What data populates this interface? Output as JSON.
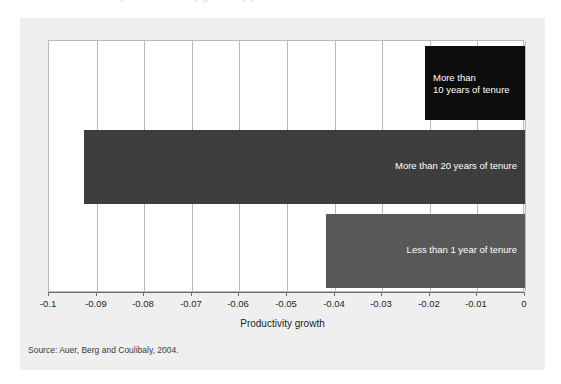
{
  "figure": {
    "ghost_title": "Figure: Productivity growth by job tenure",
    "background_color": "#efeff0",
    "plot_background_color": "#ffffff",
    "grid_color": "#b9babd",
    "axis_color": "#6d6e71"
  },
  "source_note": "Source: Auer, Berg and Coulibaly, 2004.",
  "chart_data": {
    "type": "bar",
    "orientation": "horizontal",
    "title": "",
    "xlabel": "Productivity growth",
    "ylabel": "",
    "xlim": [
      -0.1,
      0
    ],
    "grid": true,
    "legend": "none",
    "xticks": [
      -0.1,
      -0.09,
      -0.08,
      -0.07,
      -0.06,
      -0.05,
      -0.04,
      -0.03,
      -0.02,
      -0.01,
      0
    ],
    "xticklabels": [
      "-0.1",
      "-0.09",
      "-0.08",
      "-0.07",
      "-0.06",
      "-0.05",
      "-0.04",
      "-0.03",
      "-0.02",
      "-0.01",
      "0"
    ],
    "categories": [
      "More than\n10 years of tenure",
      "More than 20 years of tenure",
      "Less than 1 year of tenure"
    ],
    "values": [
      -0.021,
      -0.0927,
      -0.0418
    ],
    "colors": [
      "#0d0d0d",
      "#3d3d3d",
      "#585858"
    ],
    "bar_labels": [
      "More than\n10 years of tenure",
      "More than 20 years of tenure",
      "Less than 1 year of tenure"
    ],
    "bar_label_color": "#ffffff"
  }
}
